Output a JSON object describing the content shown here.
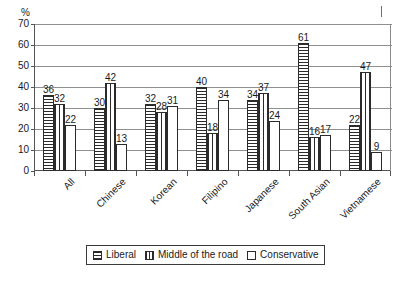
{
  "chart_data": {
    "type": "bar",
    "title": "",
    "xlabel": "",
    "ylabel": "%",
    "ylim": [
      0,
      70
    ],
    "ytick_step": 10,
    "yticks": [
      0,
      10,
      20,
      30,
      40,
      50,
      60,
      70
    ],
    "grid": true,
    "legend_position": "bottom",
    "categories": [
      "All",
      "Chinese",
      "Korean",
      "Filipino",
      "Japanese",
      "South Asian",
      "Vietnamese"
    ],
    "series": [
      {
        "name": "Liberal",
        "pattern": "horizontal-hatch",
        "values": [
          36,
          30,
          32,
          40,
          34,
          61,
          22
        ]
      },
      {
        "name": "Middle of the road",
        "pattern": "vertical-hatch",
        "values": [
          32,
          42,
          28,
          18,
          37,
          16,
          47
        ]
      },
      {
        "name": "Conservative",
        "pattern": "empty",
        "values": [
          22,
          13,
          31,
          34,
          24,
          17,
          9
        ]
      }
    ]
  },
  "axis": {
    "y_unit_label": "%",
    "tick_labels": [
      "70",
      "60",
      "50",
      "40",
      "30",
      "20",
      "10",
      "0"
    ]
  },
  "legend": {
    "items": [
      {
        "label": "Liberal",
        "swatch": "horizontal-hatch-swatch"
      },
      {
        "label": "Middle of the road",
        "swatch": "vertical-hatch-swatch"
      },
      {
        "label": "Conservative",
        "swatch": "empty-swatch"
      }
    ]
  }
}
